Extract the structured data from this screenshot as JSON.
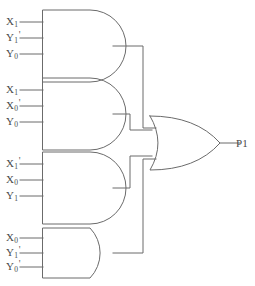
{
  "diagram": {
    "stroke_color": "#6b6b6b",
    "text_color": "#4a4a4a",
    "background": "#ffffff"
  },
  "gates": [
    {
      "id": "and-gate-1",
      "type": "AND",
      "inputs": [
        {
          "base": "X",
          "subscript": "1",
          "prime": ""
        },
        {
          "base": "Y",
          "subscript": "1",
          "prime": "'"
        },
        {
          "base": "Y",
          "subscript": "0",
          "prime": ""
        }
      ]
    },
    {
      "id": "and-gate-2",
      "type": "AND",
      "inputs": [
        {
          "base": "X",
          "subscript": "1",
          "prime": ""
        },
        {
          "base": "X",
          "subscript": "0",
          "prime": "'"
        },
        {
          "base": "Y",
          "subscript": "0",
          "prime": ""
        }
      ]
    },
    {
      "id": "and-gate-3",
      "type": "AND",
      "inputs": [
        {
          "base": "X",
          "subscript": "1",
          "prime": "'"
        },
        {
          "base": "X",
          "subscript": "0",
          "prime": ""
        },
        {
          "base": "Y",
          "subscript": "1",
          "prime": ""
        }
      ]
    },
    {
      "id": "and-gate-4",
      "type": "AND",
      "inputs": [
        {
          "base": "X",
          "subscript": "0",
          "prime": ""
        },
        {
          "base": "Y",
          "subscript": "1",
          "prime": "'"
        },
        {
          "base": "Y",
          "subscript": "0",
          "prime": "'"
        }
      ]
    }
  ],
  "or_gate": {
    "id": "or-gate-1",
    "type": "OR",
    "input_count": 4
  },
  "output": {
    "base": "P",
    "subscript": "1",
    "prime": ""
  }
}
